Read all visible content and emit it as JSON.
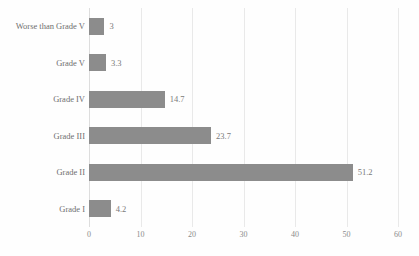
{
  "chart_data": {
    "type": "bar",
    "orientation": "horizontal",
    "title": "",
    "subtitle": "",
    "xlabel": "",
    "ylabel": "",
    "xlim": [
      0,
      60
    ],
    "xticks": [
      0,
      10,
      20,
      30,
      40,
      50,
      60
    ],
    "grid": true,
    "legend": false,
    "legend_position": "none",
    "categories": [
      "Worse than Grade V",
      "Grade V",
      "Grade IV",
      "Grade III",
      "Grade II",
      "Grade I"
    ],
    "values": [
      3,
      3.3,
      14.7,
      23.7,
      51.2,
      4.2
    ],
    "data_labels": [
      "3",
      "3.3",
      "14.7",
      "23.7",
      "51.2",
      "4.2"
    ],
    "series": [
      {
        "name": "",
        "values": [
          3,
          3.3,
          14.7,
          23.7,
          51.2,
          4.2
        ]
      }
    ],
    "colors": {
      "bar": "#8c8c8c",
      "gridline": "#e9e9e9",
      "axis": "#dddddd",
      "label_text": "#6f6f6f",
      "value_text": "#7a7a7a",
      "tick_text": "#8b8b8b",
      "background": "#fefefe"
    }
  },
  "axis": {
    "x_tick_labels": [
      "0",
      "10",
      "20",
      "30",
      "40",
      "50",
      "60"
    ]
  },
  "rows": [
    {
      "label": "Worse than Grade V",
      "value": "3"
    },
    {
      "label": "Grade V",
      "value": "3.3"
    },
    {
      "label": "Grade IV",
      "value": "14.7"
    },
    {
      "label": "Grade III",
      "value": "23.7"
    },
    {
      "label": "Grade II",
      "value": "51.2"
    },
    {
      "label": "Grade I",
      "value": "4.2"
    }
  ]
}
